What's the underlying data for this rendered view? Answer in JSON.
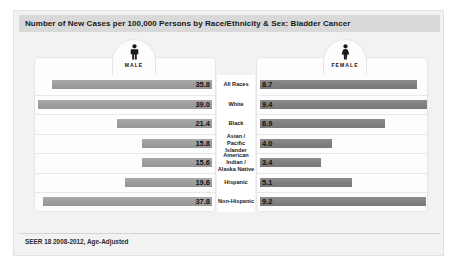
{
  "header": {
    "title": "Number of New Cases per 100,000 Persons by Race/Ethnicity & Sex: Bladder Cancer"
  },
  "legend": {
    "male_label": "MALE",
    "male_icon": "male-figure-icon",
    "female_label": "FEMALE",
    "female_icon": "female-figure-icon"
  },
  "footer": {
    "source": "SEER 18 2008-2012, Age-Adjusted"
  },
  "colors": {
    "card_background": "#f2f2f2",
    "title_bar": "#d9d9d9",
    "panel": "#fdfdfd",
    "male_bar": "#9d9d9d",
    "female_bar": "#808080",
    "separator": "#e8e8e8"
  },
  "chart_data": {
    "type": "bar",
    "title": "Number of New Cases per 100,000 Persons by Race/Ethnicity & Sex: Bladder Cancer",
    "subtitle": "",
    "xlabel": "Number of New Cases per 100,000 Persons",
    "ylabel": "Race/Ethnicity",
    "orientation": "horizontal",
    "layout": "diverging-bidirectional",
    "grid": false,
    "legend_position": "top",
    "note": "SEER 18 2008-2012, Age-Adjusted",
    "categories": [
      "All Races",
      "White",
      "Black",
      "Asian /\nPacific Islander",
      "American Indian /\nAlaska Native",
      "Hispanic",
      "Non-Hispanic"
    ],
    "series": [
      {
        "name": "MALE",
        "side": "left",
        "values": [
          35.8,
          39.0,
          21.4,
          15.8,
          15.6,
          19.6,
          37.8
        ]
      },
      {
        "name": "FEMALE",
        "side": "right",
        "values": [
          8.7,
          9.4,
          6.9,
          4.0,
          3.4,
          5.1,
          9.2
        ]
      }
    ],
    "xlim": [
      0,
      39.0
    ],
    "rows": [
      {
        "label": "All Races",
        "male": "35.8",
        "female": "8.7"
      },
      {
        "label": "White",
        "male": "39.0",
        "female": "9.4"
      },
      {
        "label": "Black",
        "male": "21.4",
        "female": "6.9"
      },
      {
        "label": "Asian /\nPacific Islander",
        "male": "15.8",
        "female": "4.0"
      },
      {
        "label": "American Indian /\nAlaska Native",
        "male": "15.6",
        "female": "3.4"
      },
      {
        "label": "Hispanic",
        "male": "19.6",
        "female": "5.1"
      },
      {
        "label": "Non-Hispanic",
        "male": "37.8",
        "female": "9.2"
      }
    ]
  }
}
